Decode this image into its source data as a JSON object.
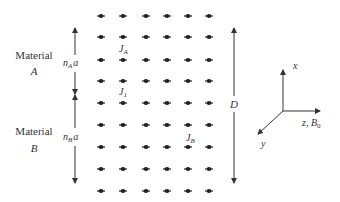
{
  "diagram": {
    "type": "lattice-schematic",
    "grid": {
      "columns_x": [
        101,
        123,
        146,
        167,
        188,
        209
      ],
      "rows_y": [
        16,
        37,
        60,
        81,
        103,
        125,
        147,
        169,
        191
      ],
      "dot_color": "#222222"
    },
    "materials": [
      {
        "word": "Material",
        "letter": "A",
        "word_pos": [
          34,
          59
        ],
        "letter_pos": [
          34,
          75
        ]
      },
      {
        "word": "Material",
        "letter": "B",
        "word_pos": [
          34,
          135
        ],
        "letter_pos": [
          34,
          152
        ]
      }
    ],
    "thickness_labels": [
      {
        "n": "n",
        "sub": "A",
        "a": "a",
        "pos": [
          63,
          66
        ]
      },
      {
        "n": "n",
        "sub": "B",
        "a": "a",
        "pos": [
          63,
          140
        ]
      }
    ],
    "coupling_labels": [
      {
        "J": "J",
        "sub": "A",
        "pos": [
          119,
          52
        ]
      },
      {
        "J": "J",
        "sub": "1",
        "pos": [
          119,
          95
        ]
      },
      {
        "J": "J",
        "sub": "B",
        "pos": [
          186,
          141
        ]
      }
    ],
    "total_thickness": {
      "label": "D",
      "x": 234,
      "y_top": 27,
      "y_bottom": 184
    },
    "axes": {
      "origin": [
        283,
        111
      ],
      "x_label": "x",
      "y_label": "y",
      "z_label": "z",
      "field_label": "B",
      "field_sub": "0"
    }
  }
}
